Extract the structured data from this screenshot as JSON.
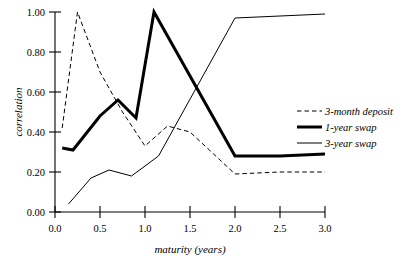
{
  "chart_data": {
    "type": "line",
    "title": "",
    "xlabel": "maturity (years)",
    "ylabel": "correlation",
    "xlim": [
      0.0,
      3.0
    ],
    "ylim": [
      0.0,
      1.0
    ],
    "xticks": [
      "0.0",
      "0.5",
      "1.0",
      "1.5",
      "2.0",
      "2.5",
      "3.0"
    ],
    "xtick_values": [
      0.0,
      0.5,
      1.0,
      1.5,
      2.0,
      2.5,
      3.0
    ],
    "yticks": [
      "0.00",
      "0.20",
      "0.40",
      "0.60",
      "0.80",
      "1.00"
    ],
    "ytick_values": [
      0.0,
      0.2,
      0.4,
      0.6,
      0.8,
      1.0
    ],
    "grid": false,
    "legend_position": "center-right",
    "series": [
      {
        "name": "3-month deposit",
        "style": "dashed",
        "stroke_width": 1.0,
        "color": "#000000",
        "x": [
          0.08,
          0.25,
          0.5,
          0.75,
          1.0,
          1.25,
          1.5,
          2.0,
          2.5,
          3.0
        ],
        "values": [
          0.42,
          1.0,
          0.7,
          0.5,
          0.33,
          0.43,
          0.4,
          0.19,
          0.2,
          0.2
        ]
      },
      {
        "name": "1-year swap",
        "style": "solid",
        "stroke_width": 3.0,
        "color": "#000000",
        "x": [
          0.08,
          0.2,
          0.5,
          0.7,
          0.9,
          1.1,
          2.0,
          2.5,
          3.0
        ],
        "values": [
          0.32,
          0.31,
          0.48,
          0.56,
          0.47,
          1.0,
          0.28,
          0.28,
          0.29
        ]
      },
      {
        "name": "3-year swap",
        "style": "solid",
        "stroke_width": 1.0,
        "color": "#000000",
        "x": [
          0.15,
          0.4,
          0.6,
          0.85,
          1.15,
          2.0,
          2.5,
          3.0
        ],
        "values": [
          0.04,
          0.17,
          0.21,
          0.18,
          0.28,
          0.97,
          0.98,
          0.99
        ]
      }
    ]
  },
  "legend": {
    "entries": [
      {
        "label": "3-month deposit"
      },
      {
        "label": "1-year swap"
      },
      {
        "label": "3-year swap"
      }
    ]
  }
}
